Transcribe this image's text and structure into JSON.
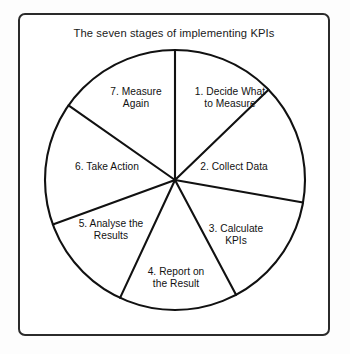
{
  "figure": {
    "title": "The seven stages of implementing KPIs",
    "frame_color": "#2b2b2b",
    "background_color": "#ffffff",
    "line_color": "#111111"
  },
  "chart_data": {
    "type": "pie",
    "title": "The seven stages of implementing KPIs",
    "xlabel": "",
    "ylabel": "",
    "legend": "none",
    "grid": false,
    "center": {
      "x": 175,
      "y": 180
    },
    "radius": 130,
    "categories": [
      "1. Decide What to Measure",
      "2. Collect Data",
      "3. Calculate KPIs",
      "4. Report on the Result",
      "5. Analyse the Results",
      "6. Take Action",
      "7. Measure Again"
    ],
    "values": [
      46,
      54,
      52,
      53,
      45,
      55,
      55
    ],
    "unit": "degrees",
    "slices": [
      {
        "index": 1,
        "label": "1. Decide What to Measure",
        "line1": "1. Decide What",
        "line2": "to Measure",
        "start_deg": 0,
        "end_deg": 46
      },
      {
        "index": 2,
        "label": "2. Collect Data",
        "line1": "2. Collect Data",
        "line2": "",
        "start_deg": 46,
        "end_deg": 100
      },
      {
        "index": 3,
        "label": "3. Calculate KPIs",
        "line1": "3. Calculate",
        "line2": "KPIs",
        "start_deg": 100,
        "end_deg": 152
      },
      {
        "index": 4,
        "label": "4. Report on the Result",
        "line1": "4. Report on",
        "line2": "the Result",
        "start_deg": 152,
        "end_deg": 205
      },
      {
        "index": 5,
        "label": "5. Analyse the Results",
        "line1": "5. Analyse the",
        "line2": "Results",
        "start_deg": 205,
        "end_deg": 250
      },
      {
        "index": 6,
        "label": "6. Take Action",
        "line1": "6. Take Action",
        "line2": "",
        "start_deg": 250,
        "end_deg": 305
      },
      {
        "index": 7,
        "label": "7. Measure Again",
        "line1": "7. Measure",
        "line2": "Again",
        "start_deg": 305,
        "end_deg": 360
      }
    ]
  }
}
